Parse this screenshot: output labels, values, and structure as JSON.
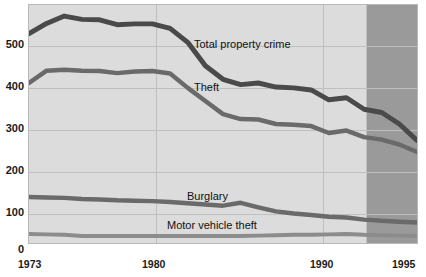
{
  "chart_data": {
    "type": "line",
    "title": "",
    "subtitle": "",
    "xlabel": "",
    "ylabel": "",
    "xlim": [
      1973,
      1995
    ],
    "ylim": [
      0,
      580
    ],
    "grid": true,
    "legend_position": "inline-annotations",
    "yticks": [
      0,
      100,
      200,
      300,
      400,
      500
    ],
    "xticks": [
      1973,
      1980,
      1990,
      1995
    ],
    "x": [
      1973,
      1974,
      1975,
      1976,
      1977,
      1978,
      1979,
      1980,
      1981,
      1982,
      1983,
      1984,
      1985,
      1986,
      1987,
      1988,
      1989,
      1990,
      1991,
      1992,
      1993,
      1994,
      1995
    ],
    "projection_start_year": 1993,
    "series": [
      {
        "name": "Total property crime",
        "values": [
          510,
          535,
          553,
          545,
          544,
          532,
          534,
          534,
          523,
          489,
          432,
          399,
          386,
          390,
          380,
          378,
          373,
          349,
          354,
          326,
          318,
          290,
          250
        ],
        "color": "#4a4a4a"
      },
      {
        "name": "Theft",
        "values": [
          390,
          420,
          422,
          420,
          419,
          414,
          418,
          419,
          413,
          378,
          346,
          314,
          302,
          301,
          290,
          288,
          285,
          268,
          274,
          258,
          252,
          240,
          222
        ],
        "color": "#6a6a6a"
      },
      {
        "name": "Burglary",
        "values": [
          112,
          111,
          110,
          107,
          106,
          104,
          103,
          102,
          100,
          97,
          94,
          91,
          98,
          87,
          77,
          72,
          68,
          64,
          62,
          57,
          54,
          52,
          50
        ],
        "color": "#6a6a6a"
      },
      {
        "name": "Motor vehicle theft",
        "values": [
          22,
          21,
          20,
          17,
          17,
          17,
          17,
          17,
          17,
          17,
          17,
          17,
          17,
          18,
          19,
          20,
          20,
          21,
          22,
          20,
          19,
          18,
          17
        ],
        "color": "#8c8c8c"
      }
    ],
    "annotations": [
      {
        "text": "Total property crime",
        "x_px": 193,
        "y_px": 41
      },
      {
        "text": "Theft",
        "x_px": 193,
        "y_px": 84
      },
      {
        "text": "Burglary",
        "x_px": 186,
        "y_px": 193
      },
      {
        "text": "Motor vehicle theft",
        "x_px": 166,
        "y_px": 222
      }
    ],
    "colors": {
      "plot_background": "#dcdcdc",
      "projection_background": "#9a9a9a",
      "grid": "#bfbfbf",
      "axis_text": "#1a1a1a",
      "annotation_text": "#111111"
    }
  }
}
